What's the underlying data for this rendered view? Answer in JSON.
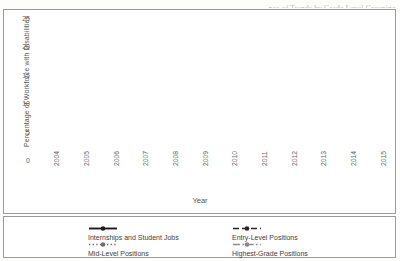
{
  "figure": {
    "cropped_title": "…nce of Trends by Grade Level Grouping",
    "axis_x_title": "Year",
    "axis_y_title": "Percentage of Workforce with Disabilities"
  },
  "chart_data": {
    "type": "line",
    "title": "",
    "xlabel": "Year",
    "ylabel": "Percentage of Workforce with Disabilities",
    "categories": [
      "2004",
      "2005",
      "2006",
      "2007",
      "2008",
      "2009",
      "2010",
      "2011",
      "2012",
      "2013",
      "2014",
      "2015"
    ],
    "ylim": [
      0,
      25
    ],
    "yticks": [
      0,
      5,
      10,
      15,
      20,
      25
    ],
    "grid": "horizontal",
    "legend_position": "bottom",
    "series": [
      {
        "name": "Internships and Student Jobs",
        "style": "solid-black-marker",
        "color": "#1a1a1a",
        "values": [
          9.2,
          19.2,
          8.8,
          12.2,
          12.3,
          13.9,
          9.4,
          14.6,
          20.0,
          18.8,
          23.2,
          20.1
        ]
      },
      {
        "name": "Entry-Level Positions",
        "style": "dashed-black-marker",
        "color": "#262626",
        "values": [
          8.0,
          9.7,
          8.3,
          9.3,
          8.8,
          8.7,
          8.8,
          8.9,
          8.9,
          11.5,
          11.7,
          11.6
        ]
      },
      {
        "name": "Mid-Level Positions",
        "style": "dotted-gray-marker",
        "color": "#6e6e6e",
        "values": [
          5.6,
          5.5,
          6.2,
          6.4,
          6.0,
          5.9,
          6.0,
          6.4,
          7.0,
          7.6,
          7.8,
          9.0
        ]
      },
      {
        "name": "Highest-Grade Positions",
        "style": "dashdot-gray-marker",
        "color": "#8a8a8a",
        "values": [
          5.6,
          5.4,
          5.6,
          5.4,
          5.3,
          5.2,
          5.2,
          5.3,
          5.9,
          6.8,
          6.6,
          7.1
        ]
      }
    ]
  },
  "legend": {
    "items": [
      {
        "label": "Internships and Student Jobs"
      },
      {
        "label": "Entry-Level Positions"
      },
      {
        "label": "Mid-Level Positions"
      },
      {
        "label": "Highest-Grade Positions"
      }
    ]
  }
}
